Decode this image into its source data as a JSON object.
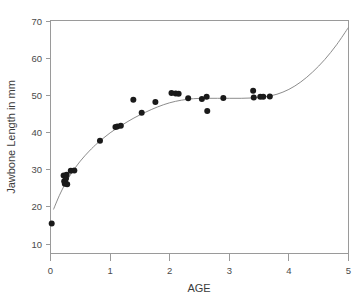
{
  "chart_data": {
    "type": "scatter",
    "title": "",
    "xlabel": "AGE",
    "ylabel": "Jawbone Length in mm",
    "xlim": [
      0,
      5
    ],
    "ylim": [
      10,
      70
    ],
    "xticks": [
      0,
      1,
      2,
      3,
      4,
      5
    ],
    "yticks": [
      10,
      20,
      30,
      40,
      50,
      60,
      70
    ],
    "xtick_labels": [
      "0",
      "1",
      "2",
      "3",
      "4",
      "5"
    ],
    "ytick_labels": [
      "10",
      "20",
      "30",
      "40",
      "50",
      "60",
      "70"
    ],
    "grid": false,
    "legend": null,
    "legend_position": "none",
    "point_color": "#1a1a1a",
    "curve_color": "#8c8c8c",
    "frame_color": "#9a9a9a",
    "background_color": "#ffffff",
    "points": [
      {
        "x": 0.02,
        "y": 15.5
      },
      {
        "x": 0.22,
        "y": 28.4
      },
      {
        "x": 0.23,
        "y": 26.9
      },
      {
        "x": 0.24,
        "y": 26.2
      },
      {
        "x": 0.25,
        "y": 26.4
      },
      {
        "x": 0.26,
        "y": 27.6
      },
      {
        "x": 0.27,
        "y": 28.6
      },
      {
        "x": 0.28,
        "y": 26.1
      },
      {
        "x": 0.34,
        "y": 29.7
      },
      {
        "x": 0.4,
        "y": 29.8
      },
      {
        "x": 0.83,
        "y": 37.8
      },
      {
        "x": 1.09,
        "y": 41.5
      },
      {
        "x": 1.12,
        "y": 41.6
      },
      {
        "x": 1.18,
        "y": 41.8
      },
      {
        "x": 1.39,
        "y": 48.8
      },
      {
        "x": 1.53,
        "y": 45.3
      },
      {
        "x": 1.76,
        "y": 48.2
      },
      {
        "x": 2.03,
        "y": 50.6
      },
      {
        "x": 2.1,
        "y": 50.5
      },
      {
        "x": 2.15,
        "y": 50.4
      },
      {
        "x": 2.31,
        "y": 49.2
      },
      {
        "x": 2.54,
        "y": 49.0
      },
      {
        "x": 2.62,
        "y": 49.6
      },
      {
        "x": 2.63,
        "y": 45.8
      },
      {
        "x": 2.9,
        "y": 49.3
      },
      {
        "x": 3.4,
        "y": 51.2
      },
      {
        "x": 3.41,
        "y": 49.4
      },
      {
        "x": 3.52,
        "y": 49.6
      },
      {
        "x": 3.57,
        "y": 49.6
      },
      {
        "x": 3.68,
        "y": 49.7
      }
    ],
    "curve": {
      "name": "fitted nonlinear trend",
      "points": [
        {
          "x": 0.05,
          "y": 19.3
        },
        {
          "x": 0.15,
          "y": 23.1
        },
        {
          "x": 0.25,
          "y": 26.3
        },
        {
          "x": 0.35,
          "y": 29.0
        },
        {
          "x": 0.5,
          "y": 32.3
        },
        {
          "x": 0.65,
          "y": 35.0
        },
        {
          "x": 0.8,
          "y": 37.3
        },
        {
          "x": 1.0,
          "y": 39.9
        },
        {
          "x": 1.2,
          "y": 42.0
        },
        {
          "x": 1.4,
          "y": 43.9
        },
        {
          "x": 1.6,
          "y": 45.5
        },
        {
          "x": 1.8,
          "y": 46.9
        },
        {
          "x": 2.0,
          "y": 48.0
        },
        {
          "x": 2.2,
          "y": 48.7
        },
        {
          "x": 2.4,
          "y": 49.1
        },
        {
          "x": 2.6,
          "y": 49.2
        },
        {
          "x": 2.8,
          "y": 49.2
        },
        {
          "x": 3.0,
          "y": 49.2
        },
        {
          "x": 3.2,
          "y": 49.2
        },
        {
          "x": 3.4,
          "y": 49.3
        },
        {
          "x": 3.6,
          "y": 49.6
        },
        {
          "x": 3.8,
          "y": 50.3
        },
        {
          "x": 4.0,
          "y": 51.6
        },
        {
          "x": 4.2,
          "y": 53.6
        },
        {
          "x": 4.4,
          "y": 56.3
        },
        {
          "x": 4.6,
          "y": 59.6
        },
        {
          "x": 4.8,
          "y": 63.6
        },
        {
          "x": 5.0,
          "y": 68.3
        }
      ]
    }
  },
  "figure": {
    "xlabel": "AGE",
    "ylabel": "Jawbone Length in mm"
  }
}
